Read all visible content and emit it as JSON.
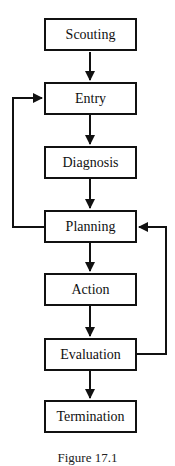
{
  "diagram": {
    "type": "flowchart",
    "nodes": [
      {
        "id": "scouting",
        "label": "Scouting"
      },
      {
        "id": "entry",
        "label": "Entry"
      },
      {
        "id": "diagnosis",
        "label": "Diagnosis"
      },
      {
        "id": "planning",
        "label": "Planning"
      },
      {
        "id": "action",
        "label": "Action"
      },
      {
        "id": "evaluation",
        "label": "Evaluation"
      },
      {
        "id": "termination",
        "label": "Termination"
      }
    ],
    "edges": [
      {
        "from": "scouting",
        "to": "entry"
      },
      {
        "from": "entry",
        "to": "diagnosis"
      },
      {
        "from": "diagnosis",
        "to": "planning"
      },
      {
        "from": "planning",
        "to": "action"
      },
      {
        "from": "action",
        "to": "evaluation"
      },
      {
        "from": "evaluation",
        "to": "termination"
      },
      {
        "from": "planning",
        "to": "entry",
        "kind": "feedback-left"
      },
      {
        "from": "evaluation",
        "to": "planning",
        "kind": "feedback-right"
      }
    ],
    "caption": "Figure 17.1"
  }
}
